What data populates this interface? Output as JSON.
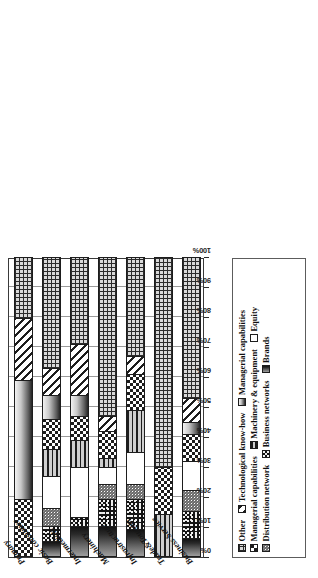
{
  "chart_data": {
    "type": "bar",
    "subtype": "stacked-100-horizontal",
    "title": "",
    "xlabel": "",
    "ylabel": "Sectors",
    "axis_title": "Sectors",
    "xlim": [
      0,
      100
    ],
    "grid": true,
    "legend_position": "top",
    "tick_labels": [
      "0%",
      "10%",
      "20%",
      "30%",
      "40%",
      "50%",
      "60%",
      "70%",
      "80%",
      "90%",
      "100%"
    ],
    "tick_values": [
      0,
      10,
      20,
      30,
      40,
      50,
      60,
      70,
      80,
      90,
      100
    ],
    "categories": [
      "Primary",
      "Basic consumer",
      "Intermediate",
      "Machinery",
      "Infrastructure",
      "Trade&Tourism",
      "Business Service"
    ],
    "series": [
      {
        "name": "Brands",
        "pattern": "brands-gradient",
        "values": [
          0,
          5,
          10,
          10,
          9,
          0,
          6
        ]
      },
      {
        "name": "Business networks",
        "pattern": "black-speckle",
        "values": [
          0,
          5,
          3,
          9,
          10,
          0,
          9
        ]
      },
      {
        "name": "Distribution network",
        "pattern": "grey-noise",
        "values": [
          0,
          6,
          0,
          5,
          5,
          0,
          7
        ]
      },
      {
        "name": "Equity",
        "pattern": "solid-white",
        "values": [
          0,
          11,
          17,
          6,
          11,
          0,
          10
        ]
      },
      {
        "name": "Machinery & equipment",
        "pattern": "horizontal-lines",
        "values": [
          0,
          9,
          9,
          3,
          14,
          14,
          0
        ]
      },
      {
        "name": "Managerial capabilities",
        "pattern": "checkerboard",
        "values": [
          19,
          10,
          8,
          9,
          12,
          16,
          9
        ]
      },
      {
        "name": "Managerial capabilities",
        "pattern": "vertical-gradient",
        "values": [
          40,
          8,
          7,
          0,
          0,
          0,
          4
        ]
      },
      {
        "name": "Technological know-how",
        "pattern": "diagonal-stripes",
        "values": [
          21,
          9,
          17,
          5,
          6,
          0,
          8
        ]
      },
      {
        "name": "Other",
        "pattern": "dense-grid",
        "values": [
          20,
          37,
          29,
          53,
          33,
          70,
          47
        ]
      }
    ]
  },
  "legend": {
    "items": [
      {
        "label": "Other"
      },
      {
        "label": "Technological know-how"
      },
      {
        "label": "Managerial capabilities"
      },
      {
        "label": "Managerial capabilities"
      },
      {
        "label": "Machinery & equipment"
      },
      {
        "label": "Equity"
      },
      {
        "label": "Distribution network"
      },
      {
        "label": "Business networks"
      },
      {
        "label": "Brands"
      }
    ]
  },
  "colors": {
    "axis": "#2b2b2b",
    "grid": "#9a9a9a",
    "bar_outline": "#1d1d1d",
    "background": "#ffffff"
  }
}
